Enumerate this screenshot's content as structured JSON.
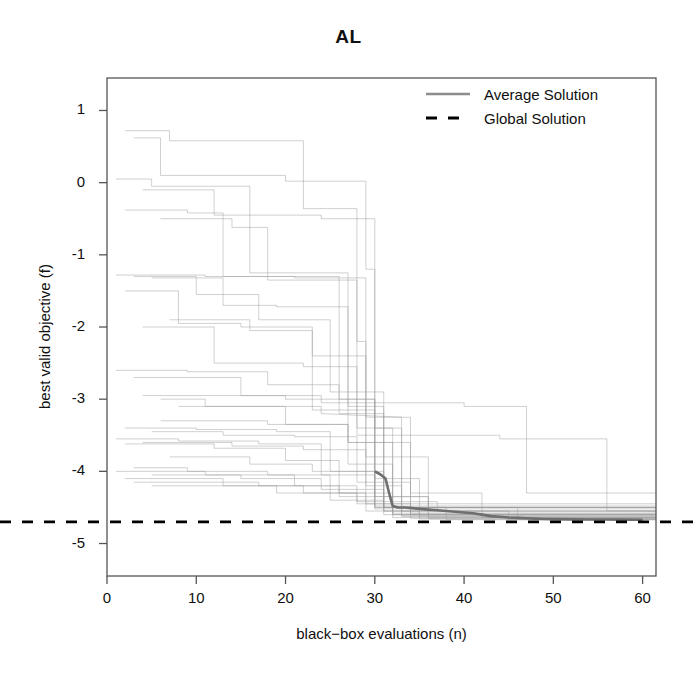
{
  "chart_data": {
    "type": "line",
    "title": "AL",
    "xlabel": "black−box evaluations (n)",
    "ylabel": "best valid objective (f)",
    "xlim": [
      0,
      61.5
    ],
    "ylim": [
      -5.45,
      1.45
    ],
    "xticks": [
      0,
      10,
      20,
      30,
      40,
      50,
      60
    ],
    "xtick_labels": [
      "0",
      "10",
      "20",
      "30",
      "40",
      "50",
      "60"
    ],
    "yticks": [
      1,
      0,
      -1,
      -2,
      -3,
      -4,
      -5
    ],
    "ytick_labels": [
      "1",
      "0",
      "-1",
      "-2",
      "-3",
      "-4",
      "-5"
    ],
    "grid": false,
    "legend_position": "top-right",
    "legend": [
      {
        "label": "Average Solution",
        "style": "solid",
        "color": "#8c8c8c",
        "width": 2.4
      },
      {
        "label": "Global Solution",
        "style": "dashed",
        "color": "#000000",
        "width": 2.6
      }
    ],
    "annotations": [
      {
        "name": "global-solution-level",
        "value": -4.7,
        "description": "horizontal dashed reference line"
      }
    ],
    "series": [
      {
        "name": "Average Solution",
        "role": "average",
        "color": "#6e6e6e",
        "width": 2.6,
        "x": [
          30.0,
          30.6,
          31.2,
          31.6,
          32.0,
          32.6,
          33.4,
          34.2,
          35.0,
          36.0,
          37.0,
          38.0,
          39.0,
          40.0,
          41.0,
          42.0,
          43.0,
          44.0,
          45.0,
          46.0,
          47.0,
          48.0,
          49.0,
          50.0,
          52.0,
          54.0,
          56.0,
          58.0,
          60.0
        ],
        "y": [
          -4.0,
          -4.04,
          -4.1,
          -4.3,
          -4.48,
          -4.5,
          -4.5,
          -4.51,
          -4.52,
          -4.53,
          -4.54,
          -4.55,
          -4.56,
          -4.57,
          -4.58,
          -4.6,
          -4.62,
          -4.63,
          -4.64,
          -4.645,
          -4.65,
          -4.655,
          -4.66,
          -4.662,
          -4.665,
          -4.667,
          -4.668,
          -4.669,
          -4.67
        ]
      },
      {
        "name": "Global Solution",
        "role": "reference",
        "color": "#000000",
        "width": 2.6,
        "constant_y": -4.7
      }
    ],
    "runs_description": "Individual optimization run traces: monotone non-increasing step functions, light gray, 30 replicates",
    "runs": [
      {
        "x": [
          2,
          7,
          7,
          22,
          22,
          28,
          28,
          29,
          29,
          61.5
        ],
        "y": [
          0.72,
          0.72,
          0.58,
          0.58,
          -0.36,
          -0.36,
          -2.2,
          -2.2,
          -4.45,
          -4.45
        ]
      },
      {
        "x": [
          3,
          6,
          6,
          20,
          20,
          29,
          29,
          30,
          30,
          61.5
        ],
        "y": [
          0.62,
          0.62,
          0.1,
          0.1,
          0.02,
          0.02,
          -1.2,
          -1.2,
          -4.5,
          -4.5
        ]
      },
      {
        "x": [
          1,
          5,
          5,
          16,
          16,
          27,
          27,
          31,
          31,
          61.5
        ],
        "y": [
          0.05,
          0.05,
          -0.05,
          -0.05,
          -1.25,
          -1.25,
          -3.1,
          -3.1,
          -4.55,
          -4.55
        ]
      },
      {
        "x": [
          4,
          12,
          12,
          24,
          24,
          30,
          30,
          32,
          32,
          61.5
        ],
        "y": [
          -0.1,
          -0.1,
          -0.45,
          -0.45,
          -0.5,
          -0.5,
          -3.4,
          -3.4,
          -4.6,
          -4.6
        ]
      },
      {
        "x": [
          2,
          9,
          9,
          13,
          13,
          26,
          26,
          30,
          30,
          61.5
        ],
        "y": [
          -0.38,
          -0.38,
          -0.42,
          -0.42,
          -1.3,
          -1.3,
          -3.0,
          -3.0,
          -4.52,
          -4.52
        ]
      },
      {
        "x": [
          6,
          14,
          14,
          18,
          18,
          28,
          28,
          33,
          33,
          61.5
        ],
        "y": [
          -0.5,
          -0.5,
          -0.62,
          -0.62,
          -1.35,
          -1.35,
          -3.5,
          -3.5,
          -4.62,
          -4.62
        ]
      },
      {
        "x": [
          1,
          11,
          11,
          21,
          21,
          29,
          29,
          34,
          34,
          61.5
        ],
        "y": [
          -1.28,
          -1.28,
          -1.3,
          -1.3,
          -1.32,
          -1.32,
          -3.25,
          -3.25,
          -4.58,
          -4.58
        ]
      },
      {
        "x": [
          3,
          10,
          10,
          17,
          17,
          25,
          25,
          31,
          31,
          61.5
        ],
        "y": [
          -1.3,
          -1.3,
          -1.55,
          -1.55,
          -1.9,
          -1.9,
          -2.9,
          -2.9,
          -4.5,
          -4.5
        ]
      },
      {
        "x": [
          5,
          13,
          13,
          19,
          19,
          27,
          27,
          32,
          32,
          61.5
        ],
        "y": [
          -1.32,
          -1.32,
          -1.7,
          -1.7,
          -1.72,
          -1.72,
          -3.6,
          -3.6,
          -4.6,
          -4.6
        ]
      },
      {
        "x": [
          2,
          8,
          8,
          15,
          15,
          23,
          23,
          30,
          30,
          61.5
        ],
        "y": [
          -1.5,
          -1.5,
          -1.95,
          -1.95,
          -2.0,
          -2.0,
          -3.15,
          -3.15,
          -4.48,
          -4.48
        ]
      },
      {
        "x": [
          7,
          16,
          16,
          23,
          23,
          29,
          29,
          36,
          36,
          61.5
        ],
        "y": [
          -1.9,
          -1.9,
          -2.05,
          -2.05,
          -2.4,
          -2.4,
          -3.8,
          -3.8,
          -4.64,
          -4.64
        ]
      },
      {
        "x": [
          4,
          12,
          12,
          22,
          22,
          28,
          28,
          33,
          33,
          61.5
        ],
        "y": [
          -2.0,
          -2.0,
          -2.5,
          -2.5,
          -2.55,
          -2.55,
          -3.4,
          -3.4,
          -4.55,
          -4.55
        ]
      },
      {
        "x": [
          1,
          9,
          9,
          18,
          18,
          26,
          26,
          31,
          31,
          61.5
        ],
        "y": [
          -2.6,
          -2.6,
          -2.62,
          -2.62,
          -2.8,
          -2.8,
          -3.2,
          -3.2,
          -4.5,
          -4.5
        ]
      },
      {
        "x": [
          3,
          15,
          15,
          24,
          24,
          30,
          30,
          35,
          35,
          61.5
        ],
        "y": [
          -2.7,
          -2.7,
          -2.95,
          -2.95,
          -3.05,
          -3.05,
          -4.1,
          -4.1,
          -4.62,
          -4.62
        ]
      },
      {
        "x": [
          6,
          11,
          11,
          20,
          20,
          27,
          27,
          32,
          32,
          61.5
        ],
        "y": [
          -3.0,
          -3.0,
          -3.1,
          -3.1,
          -3.35,
          -3.35,
          -3.9,
          -3.9,
          -4.58,
          -4.58
        ]
      },
      {
        "x": [
          2,
          10,
          10,
          19,
          19,
          25,
          25,
          31,
          31,
          61.5
        ],
        "y": [
          -3.4,
          -3.4,
          -3.42,
          -3.42,
          -3.45,
          -3.45,
          -4.0,
          -4.0,
          -4.55,
          -4.55
        ]
      },
      {
        "x": [
          5,
          13,
          13,
          21,
          21,
          28,
          28,
          34,
          34,
          61.5
        ],
        "y": [
          -3.45,
          -3.45,
          -3.5,
          -3.5,
          -3.52,
          -3.52,
          -4.15,
          -4.15,
          -4.6,
          -4.6
        ]
      },
      {
        "x": [
          1,
          8,
          8,
          17,
          17,
          24,
          24,
          30,
          30,
          61.5
        ],
        "y": [
          -3.55,
          -3.55,
          -3.58,
          -3.58,
          -3.62,
          -3.62,
          -4.05,
          -4.05,
          -4.5,
          -4.5
        ]
      },
      {
        "x": [
          4,
          14,
          14,
          22,
          22,
          29,
          29,
          33,
          33,
          61.5
        ],
        "y": [
          -3.6,
          -3.6,
          -3.65,
          -3.65,
          -3.7,
          -3.7,
          -4.2,
          -4.2,
          -4.62,
          -4.62
        ]
      },
      {
        "x": [
          2,
          12,
          12,
          20,
          20,
          26,
          26,
          32,
          32,
          61.5
        ],
        "y": [
          -3.62,
          -3.62,
          -3.68,
          -3.68,
          -3.85,
          -3.85,
          -4.3,
          -4.3,
          -4.64,
          -4.64
        ]
      },
      {
        "x": [
          7,
          16,
          16,
          23,
          23,
          30,
          30,
          36,
          36,
          61.5
        ],
        "y": [
          -3.8,
          -3.8,
          -3.9,
          -3.9,
          -4.0,
          -4.0,
          -4.35,
          -4.35,
          -4.66,
          -4.66
        ]
      },
      {
        "x": [
          3,
          9,
          9,
          18,
          18,
          25,
          25,
          31,
          31,
          61.5
        ],
        "y": [
          -3.95,
          -3.95,
          -4.0,
          -4.0,
          -4.05,
          -4.05,
          -4.4,
          -4.4,
          -4.6,
          -4.6
        ]
      },
      {
        "x": [
          1,
          11,
          11,
          21,
          21,
          28,
          28,
          34,
          34,
          61.5
        ],
        "y": [
          -4.0,
          -4.0,
          -4.05,
          -4.05,
          -4.2,
          -4.2,
          -4.45,
          -4.45,
          -4.65,
          -4.65
        ]
      },
      {
        "x": [
          5,
          15,
          15,
          24,
          24,
          31,
          31,
          38,
          38,
          61.5
        ],
        "y": [
          -4.05,
          -4.05,
          -4.1,
          -4.1,
          -4.25,
          -4.25,
          -4.5,
          -4.5,
          -4.67,
          -4.67
        ]
      },
      {
        "x": [
          2,
          13,
          13,
          22,
          22,
          29,
          29,
          35,
          35,
          61.5
        ],
        "y": [
          -4.1,
          -4.1,
          -4.2,
          -4.2,
          -4.3,
          -4.3,
          -4.55,
          -4.55,
          -4.66,
          -4.66
        ]
      },
      {
        "x": [
          6,
          18,
          18,
          27,
          27,
          34,
          34,
          42,
          42,
          61.5
        ],
        "y": [
          -3.3,
          -3.3,
          -3.35,
          -3.35,
          -3.6,
          -3.6,
          -4.3,
          -4.3,
          -4.64,
          -4.64
        ]
      },
      {
        "x": [
          4,
          20,
          20,
          30,
          30,
          40,
          40,
          47,
          47,
          61.5
        ],
        "y": [
          -2.95,
          -2.95,
          -3.0,
          -3.0,
          -3.05,
          -3.05,
          -3.1,
          -3.1,
          -4.3,
          -4.3
        ]
      },
      {
        "x": [
          8,
          24,
          24,
          33,
          33,
          44,
          44,
          56,
          56,
          61.5
        ],
        "y": [
          -3.1,
          -3.1,
          -3.2,
          -3.25,
          -3.5,
          -3.5,
          -3.55,
          -3.55,
          -4.55,
          -4.55
        ]
      },
      {
        "x": [
          3,
          17,
          17,
          26,
          26,
          36,
          36,
          46,
          46,
          61.5
        ],
        "y": [
          -4.15,
          -4.15,
          -4.2,
          -4.2,
          -4.35,
          -4.35,
          -4.5,
          -4.5,
          -4.66,
          -4.66
        ]
      },
      {
        "x": [
          5,
          19,
          19,
          28,
          28,
          37,
          37,
          45,
          45,
          61.5
        ],
        "y": [
          -4.2,
          -4.2,
          -4.3,
          -4.3,
          -4.42,
          -4.42,
          -4.55,
          -4.55,
          -4.67,
          -4.67
        ]
      }
    ]
  }
}
